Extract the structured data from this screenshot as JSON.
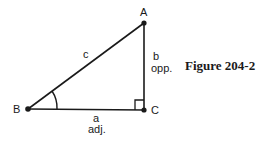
{
  "figure": {
    "caption": "Figure 204-2",
    "vertices": {
      "A": {
        "label": "A"
      },
      "B": {
        "label": "B"
      },
      "C": {
        "label": "C"
      }
    },
    "sides": {
      "hypotenuse": {
        "label": "c"
      },
      "opposite": {
        "label": "b",
        "sublabel": "opp."
      },
      "adjacent": {
        "label": "a",
        "sublabel": "adj."
      }
    },
    "marks": [
      "angle-arc-at-B",
      "right-angle-at-C"
    ]
  }
}
